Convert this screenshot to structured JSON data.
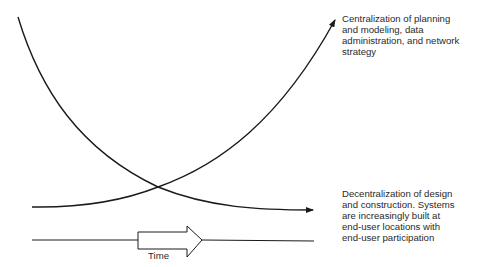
{
  "diagram": {
    "type": "trend-diagram",
    "curves": [
      {
        "id": "centralization",
        "direction": "increasing",
        "label_lines": [
          "Centralization of planning",
          "and modeling, data",
          "administration, and network",
          "strategy"
        ]
      },
      {
        "id": "decentralization",
        "direction": "decreasing",
        "label_lines": [
          "Decentralization of design",
          "and construction. Systems",
          "are increasingly built at",
          "end-user locations with",
          "end-user participation"
        ]
      }
    ],
    "time_axis": {
      "label": "Time"
    },
    "colors": {
      "stroke": "#1a1a1a",
      "background": "#ffffff",
      "text": "#2a2a2a"
    }
  }
}
